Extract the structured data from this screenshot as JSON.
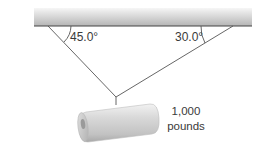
{
  "diagram": {
    "type": "force-tension-diagram",
    "ceiling": {
      "x1": 34,
      "x2": 252,
      "y_top": 8,
      "y_bottom": 26
    },
    "left_rope": {
      "anchor": [
        48,
        26
      ],
      "angle_label": "45.0°"
    },
    "right_rope": {
      "anchor": [
        233,
        26
      ],
      "angle_label": "30.0°"
    },
    "knot": [
      116,
      97
    ],
    "load": {
      "weight_line1": "1,000",
      "weight_line2": "pounds"
    },
    "colors": {
      "line": "#555555",
      "ceiling_top": "#f4f4f4",
      "ceiling_bottom": "#b8b8b8"
    }
  }
}
